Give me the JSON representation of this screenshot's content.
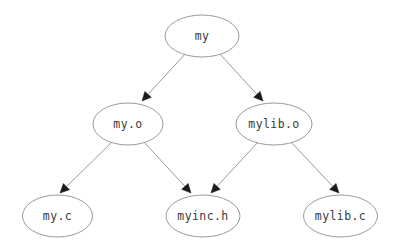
{
  "diagram": {
    "type": "directed-graph",
    "background_color": "#ffffff",
    "node_stroke_color": "#9a9a9a",
    "node_fill_color": "#ffffff",
    "label_color": "#3a3a3a",
    "edge_color": "#9a9a9a",
    "arrowhead_color": "#1b1b1b",
    "nodes": [
      {
        "id": "my",
        "label": "my",
        "cx": 202,
        "cy": 36,
        "rx": 37,
        "ry": 21
      },
      {
        "id": "my_o",
        "label": "my.o",
        "cx": 128,
        "cy": 124,
        "rx": 35,
        "ry": 21
      },
      {
        "id": "mylib_o",
        "label": "mylib.o",
        "cx": 274,
        "cy": 124,
        "rx": 38,
        "ry": 21
      },
      {
        "id": "my_c",
        "label": "my.c",
        "cx": 57.5,
        "cy": 216,
        "rx": 35,
        "ry": 21
      },
      {
        "id": "myinc_h",
        "label": "myinc.h",
        "cx": 203,
        "cy": 216,
        "rx": 37,
        "ry": 21
      },
      {
        "id": "mylib_c",
        "label": "mylib.c",
        "cx": 340.5,
        "cy": 216,
        "rx": 37,
        "ry": 21
      }
    ],
    "edges": [
      {
        "from": "my",
        "to": "my_o",
        "x1": 186,
        "y1": 53,
        "x2": 142,
        "y2": 101
      },
      {
        "from": "my",
        "to": "mylib_o",
        "x1": 219,
        "y1": 53,
        "x2": 263,
        "y2": 101
      },
      {
        "from": "my_o",
        "to": "my_c",
        "x1": 113,
        "y1": 141,
        "x2": 60,
        "y2": 193
      },
      {
        "from": "my_o",
        "to": "myinc_h",
        "x1": 143,
        "y1": 141,
        "x2": 191,
        "y2": 193
      },
      {
        "from": "mylib_o",
        "to": "myinc_h",
        "x1": 259,
        "y1": 141,
        "x2": 211,
        "y2": 193
      },
      {
        "from": "mylib_o",
        "to": "mylib_c",
        "x1": 290,
        "y1": 141,
        "x2": 339,
        "y2": 193
      }
    ]
  }
}
